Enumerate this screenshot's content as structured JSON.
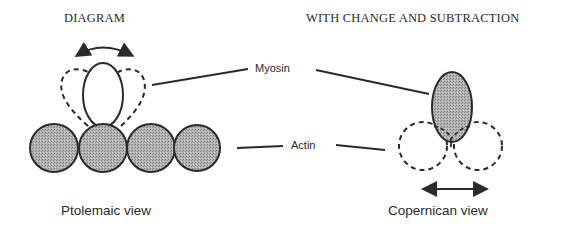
{
  "headings": {
    "left": "DIAGRAM",
    "right": "WITH CHANGE AND SUBTRACTION"
  },
  "labels": {
    "myosin": "Myosin",
    "actin": "Actin"
  },
  "captions": {
    "left": "Ptolemaic view",
    "right": "Copernican view"
  },
  "colors": {
    "stroke": "#2a2a2a",
    "fill_shaded": "#a8a8a8",
    "background": "#ffffff"
  },
  "left_panel": {
    "actin_circles": 4,
    "myosin_head": "open ellipse with two dashed alternate positions",
    "motion_indicator": "curved double-headed arrow"
  },
  "right_panel": {
    "myosin_head": "shaded ellipse",
    "actin_circles": "two dashed circles",
    "motion_indicator": "straight horizontal double-headed arrow"
  }
}
